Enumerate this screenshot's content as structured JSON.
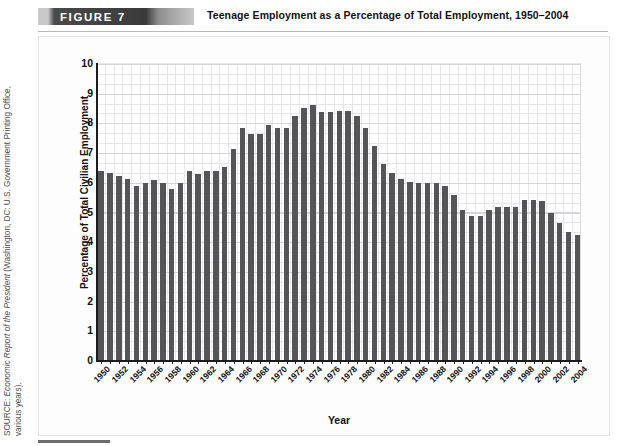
{
  "header": {
    "figure_badge": "FIGURE   7",
    "title": "Teenage Employment as a Percentage of Total Employment, 1950–2004"
  },
  "source": {
    "line1_prefix": "SOURCE: ",
    "line1_italic": "Economic Report of the President",
    "line1_suffix": " (Washington, DC: U.S. Government Printing Office,",
    "line2": "various years)."
  },
  "chart_data": {
    "type": "bar",
    "title": "Teenage Employment as a Percentage of Total Employment, 1950–2004",
    "xlabel": "Year",
    "ylabel": "Percentage of Total Civilian Employment",
    "ylim": [
      0,
      10
    ],
    "yticks": [
      0,
      1,
      2,
      3,
      4,
      5,
      6,
      7,
      8,
      9,
      10
    ],
    "grid": true,
    "legend": "none",
    "bar_color": "#555558",
    "xtick_step": 2,
    "categories": [
      1950,
      1951,
      1952,
      1953,
      1954,
      1955,
      1956,
      1957,
      1958,
      1959,
      1960,
      1961,
      1962,
      1963,
      1964,
      1965,
      1966,
      1967,
      1968,
      1969,
      1970,
      1971,
      1972,
      1973,
      1974,
      1975,
      1976,
      1977,
      1978,
      1979,
      1980,
      1981,
      1982,
      1983,
      1984,
      1985,
      1986,
      1987,
      1988,
      1989,
      1990,
      1991,
      1992,
      1993,
      1994,
      1995,
      1996,
      1997,
      1998,
      1999,
      2000,
      2001,
      2002,
      2003,
      2004
    ],
    "values": [
      6.35,
      6.3,
      6.2,
      6.1,
      5.85,
      5.95,
      6.05,
      5.95,
      5.75,
      5.95,
      6.35,
      6.25,
      6.35,
      6.35,
      6.5,
      7.1,
      7.8,
      7.6,
      7.6,
      7.9,
      7.8,
      7.8,
      8.2,
      8.5,
      8.6,
      8.35,
      8.35,
      8.4,
      8.4,
      8.2,
      7.8,
      7.2,
      6.6,
      6.3,
      6.1,
      6.0,
      5.95,
      5.95,
      5.95,
      5.85,
      5.55,
      5.05,
      4.85,
      4.85,
      5.05,
      5.15,
      5.15,
      5.15,
      5.4,
      5.4,
      5.35,
      4.95,
      4.6,
      4.3,
      4.2
    ]
  }
}
